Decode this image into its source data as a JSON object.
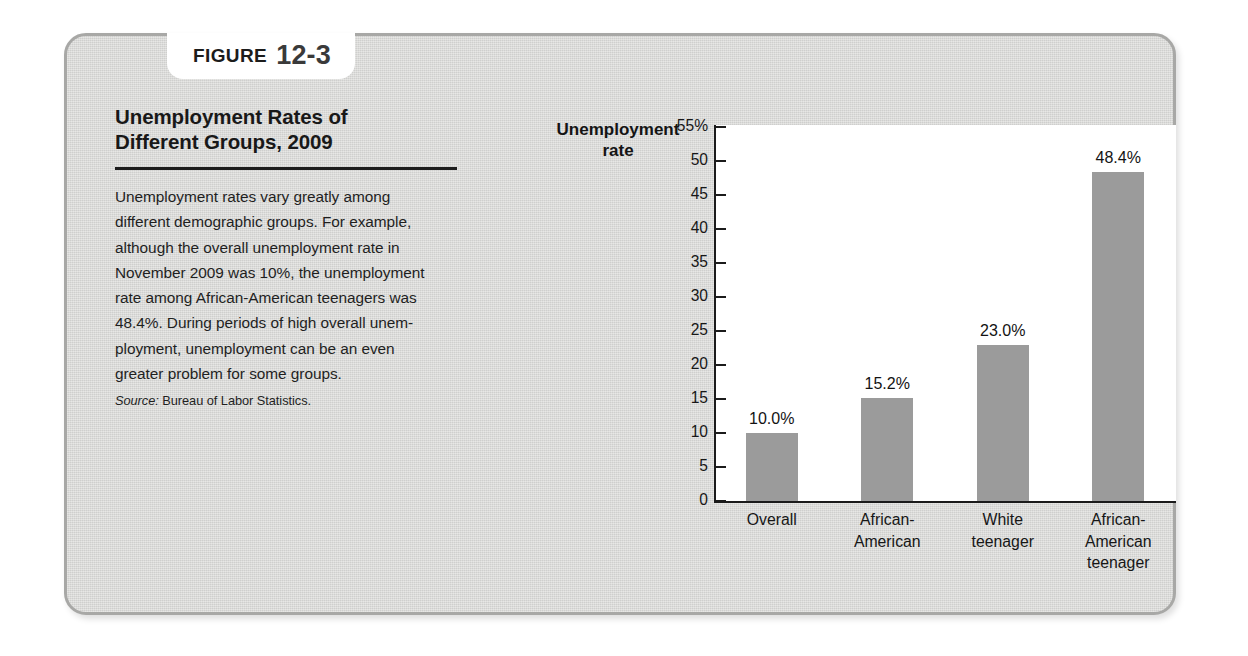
{
  "figure": {
    "label_word": "FIGURE",
    "number": "12-3"
  },
  "caption": {
    "title": "Unemployment Rates of\nDifferent Groups, 2009",
    "body": "Unemployment rates vary greatly among\ndifferent demographic groups. For example,\nalthough the overall unemployment rate in\nNovember 2009 was 10%, the unemployment\nrate among African-American teenagers was\n48.4%. During periods of high overall unem-\nployment, unemployment can be an even\ngreater problem for some groups.",
    "source_lead": "Source:",
    "source_text": " Bureau of Labor Statistics."
  },
  "colors": {
    "panel_background": "#d6d6d4",
    "panel_border": "#a8a8a6",
    "plot_background": "#ffffff",
    "bar_fill": "#9b9b9b",
    "axis": "#1b1b1b",
    "text": "#171717"
  },
  "chart_data": {
    "type": "bar",
    "title": "Unemployment Rates of Different Groups, 2009",
    "xlabel": "",
    "ylabel": "Unemployment\nrate",
    "categories": [
      "Overall",
      "African-\nAmerican",
      "White\nteenager",
      "African-\nAmerican\nteenager"
    ],
    "values": [
      10.0,
      15.2,
      23.0,
      48.4
    ],
    "value_labels": [
      "10.0%",
      "15.2%",
      "23.0%",
      "48.4%"
    ],
    "ylim": [
      0,
      55
    ],
    "ytick_values": [
      55,
      50,
      45,
      40,
      35,
      30,
      25,
      20,
      15,
      10,
      5,
      0
    ],
    "ytick_labels": [
      "55%",
      "50",
      "45",
      "40",
      "35",
      "30",
      "25",
      "20",
      "15",
      "10",
      "5",
      "0"
    ],
    "grid": false,
    "legend": null,
    "source": "Bureau of Labor Statistics."
  }
}
